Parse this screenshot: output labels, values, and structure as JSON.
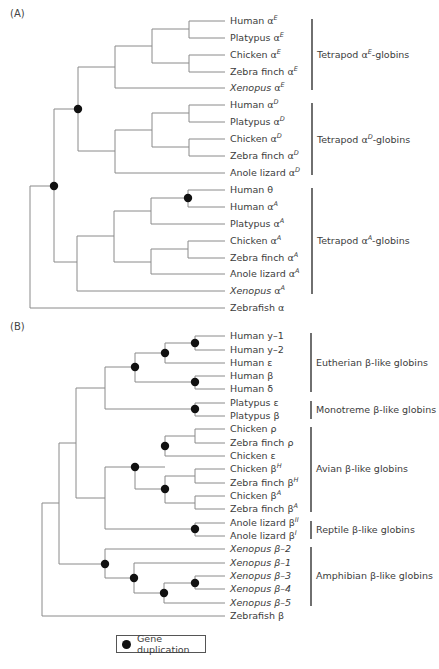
{
  "panel_a": {
    "label": "(A)",
    "leaves": [
      {
        "name": "Human",
        "symbol": "α",
        "sup": "E",
        "italic": false
      },
      {
        "name": "Platypus",
        "symbol": "α",
        "sup": "E",
        "italic": false
      },
      {
        "name": "Chicken",
        "symbol": "α",
        "sup": "E",
        "italic": false
      },
      {
        "name": "Zebra finch",
        "symbol": "α",
        "sup": "E",
        "italic": false
      },
      {
        "name": "Xenopus",
        "symbol": "α",
        "sup": "E",
        "italic": true
      },
      {
        "name": "Human",
        "symbol": "α",
        "sup": "D",
        "italic": false
      },
      {
        "name": "Platypus",
        "symbol": "α",
        "sup": "D",
        "italic": false
      },
      {
        "name": "Chicken",
        "symbol": "α",
        "sup": "D",
        "italic": false
      },
      {
        "name": "Zebra finch",
        "symbol": "α",
        "sup": "D",
        "italic": false
      },
      {
        "name": "Anole lizard",
        "symbol": "α",
        "sup": "D",
        "italic": false
      },
      {
        "name": "Human",
        "symbol": "θ",
        "sup": "",
        "italic": false
      },
      {
        "name": "Human",
        "symbol": "α",
        "sup": "A",
        "italic": false
      },
      {
        "name": "Platypus",
        "symbol": "α",
        "sup": "A",
        "italic": false
      },
      {
        "name": "Chicken",
        "symbol": "α",
        "sup": "A",
        "italic": false
      },
      {
        "name": "Zebra finch",
        "symbol": "α",
        "sup": "A",
        "italic": false
      },
      {
        "name": "Anole lizard",
        "symbol": "α",
        "sup": "A",
        "italic": false
      },
      {
        "name": "Xenopus",
        "symbol": "α",
        "sup": "A",
        "italic": true
      },
      {
        "name": "Zebrafish",
        "symbol": "α",
        "sup": "",
        "italic": false
      }
    ],
    "groups": [
      {
        "pre": "Tetrapod α",
        "sup": "E",
        "post": "-globins"
      },
      {
        "pre": "Tetrapod α",
        "sup": "D",
        "post": "-globins"
      },
      {
        "pre": "Tetrapod α",
        "sup": "A",
        "post": "-globins"
      }
    ]
  },
  "panel_b": {
    "label": "(B)",
    "leaves": [
      {
        "name": "Human",
        "symbol": "y–1",
        "sup": "",
        "italic": false
      },
      {
        "name": "Human",
        "symbol": "y–2",
        "sup": "",
        "italic": false
      },
      {
        "name": "Human",
        "symbol": "ε",
        "sup": "",
        "italic": false
      },
      {
        "name": "Human",
        "symbol": "β",
        "sup": "",
        "italic": false
      },
      {
        "name": "Human",
        "symbol": "δ",
        "sup": "",
        "italic": false
      },
      {
        "name": "Platypus",
        "symbol": "ε",
        "sup": "",
        "italic": false
      },
      {
        "name": "Platypus",
        "symbol": "β",
        "sup": "",
        "italic": false
      },
      {
        "name": "Chicken",
        "symbol": "ρ",
        "sup": "",
        "italic": false
      },
      {
        "name": "Zebra finch",
        "symbol": "ρ",
        "sup": "",
        "italic": false
      },
      {
        "name": "Chicken",
        "symbol": "ε",
        "sup": "",
        "italic": false
      },
      {
        "name": "Chicken",
        "symbol": "β",
        "sup": "H",
        "italic": false
      },
      {
        "name": "Zebra finch",
        "symbol": "β",
        "sup": "H",
        "italic": false
      },
      {
        "name": "Chicken",
        "symbol": "β",
        "sup": "A",
        "italic": false
      },
      {
        "name": "Zebra finch",
        "symbol": "β",
        "sup": "A",
        "italic": false
      },
      {
        "name": "Anole lizard",
        "symbol": "β",
        "sup": "II",
        "italic": false
      },
      {
        "name": "Anole lizard",
        "symbol": "β",
        "sup": "I",
        "italic": false
      },
      {
        "name": "Xenopus",
        "symbol": "β–2",
        "sup": "",
        "italic": true
      },
      {
        "name": "Xenopus",
        "symbol": "β–1",
        "sup": "",
        "italic": true
      },
      {
        "name": "Xenopus",
        "symbol": "β–3",
        "sup": "",
        "italic": true
      },
      {
        "name": "Xenopus",
        "symbol": "β–4",
        "sup": "",
        "italic": true
      },
      {
        "name": "Xenopus",
        "symbol": "β–5",
        "sup": "",
        "italic": true
      },
      {
        "name": "Zebrafish",
        "symbol": "β",
        "sup": "",
        "italic": false
      }
    ],
    "groups": [
      {
        "pre": "Eutherian β-like globins",
        "sup": "",
        "post": ""
      },
      {
        "pre": "Monotreme β-like globins",
        "sup": "",
        "post": ""
      },
      {
        "pre": "Avian β-like globins",
        "sup": "",
        "post": ""
      },
      {
        "pre": "Reptile β-like globins",
        "sup": "",
        "post": ""
      },
      {
        "pre": "Amphibian β-like globins",
        "sup": "",
        "post": ""
      }
    ]
  },
  "legend": {
    "icon": "gene-duplication-dot",
    "label": "Gene duplication"
  },
  "colors": {
    "branch": "#8a8a8a",
    "node": "#111111",
    "bracket": "#333333",
    "text": "#3c3c3c"
  }
}
